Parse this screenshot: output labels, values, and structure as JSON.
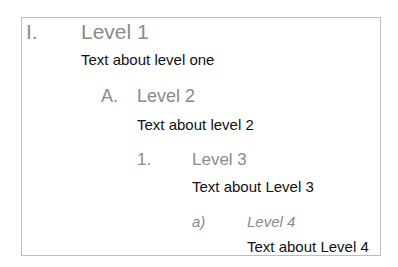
{
  "outline": {
    "level1": {
      "number": "I.",
      "heading": "Level 1",
      "text": "Text about level one"
    },
    "level2": {
      "number": "A.",
      "heading": "Level 2",
      "text": "Text about level 2"
    },
    "level3": {
      "number": "1.",
      "heading": "Level 3",
      "text": "Text about Level 3"
    },
    "level4": {
      "number": "a)",
      "heading": "Level 4",
      "text": "Text about Level 4"
    }
  }
}
